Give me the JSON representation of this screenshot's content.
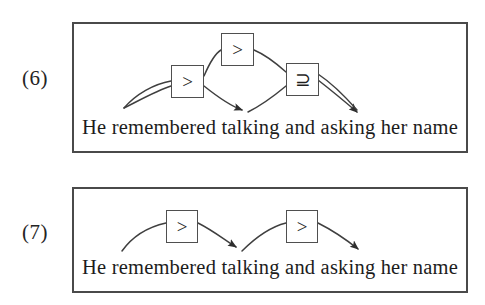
{
  "figure": {
    "background_color": "#ffffff",
    "line_color": "#3f3f3f",
    "border_color": "#4a4a4a"
  },
  "examples": [
    {
      "number": "(6)",
      "caption": "He remembered talking and asking her name",
      "boxes": [
        {
          "id": "top",
          "symbol": ">",
          "name": "relation-box-greater-top"
        },
        {
          "id": "left",
          "symbol": ">",
          "name": "relation-box-greater-left"
        },
        {
          "id": "right",
          "symbol": "⊇",
          "name": "relation-box-superset-equal-right"
        }
      ],
      "arc_count": 5,
      "arrowhead_count": 2
    },
    {
      "number": "(7)",
      "caption": "He remembered talking and asking her name",
      "boxes": [
        {
          "id": "left",
          "symbol": ">",
          "name": "relation-box-greater-left"
        },
        {
          "id": "right",
          "symbol": ">",
          "name": "relation-box-greater-right"
        }
      ],
      "arc_count": 4,
      "arrowhead_count": 2
    }
  ]
}
